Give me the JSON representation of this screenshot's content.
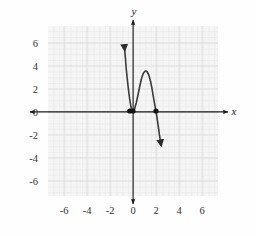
{
  "figure": {
    "background_color": "#fefefe",
    "plot_background_color": "#f5f5f5",
    "grid_minor_color": "#e4e4e4",
    "grid_major_color": "#d8d8d8",
    "axis_color": "#1a1a1a",
    "curve_color": "#3a3a3a",
    "point_color": "#141414"
  },
  "axes": {
    "x_name": "x",
    "y_name": "y",
    "x_ticks": [
      "-6",
      "-4",
      "-2",
      "0",
      "2",
      "4",
      "6"
    ],
    "y_ticks": [
      "6",
      "4",
      "2",
      "0",
      "-2",
      "-4",
      "-6"
    ],
    "x_tick_values": [
      -6,
      -4,
      -2,
      0,
      2,
      4,
      6
    ],
    "y_tick_values": [
      6,
      4,
      2,
      0,
      -2,
      -4,
      -6
    ]
  },
  "chart_data": {
    "type": "line",
    "title": "",
    "xlabel": "x",
    "ylabel": "y",
    "xlim": [
      -7.4,
      7.4
    ],
    "ylim": [
      -7.4,
      7.4
    ],
    "grid": true,
    "grid_minor_step": 0.5,
    "grid_major_step": 2,
    "legend": "none",
    "series": [
      {
        "name": "cubic",
        "equation": "y = -2.7x^2(x - 2)",
        "style": "solid-with-arrowheads",
        "arrow_start": {
          "x": -0.72,
          "y": 7.4
        },
        "arrow_end": {
          "x": 2.45,
          "y": -7.4
        },
        "x": [
          -0.72,
          -0.65,
          -0.6,
          -0.5,
          -0.4,
          -0.3,
          -0.2,
          -0.1,
          0.0,
          0.15,
          0.3,
          0.45,
          0.6,
          0.75,
          0.9,
          1.05,
          1.2,
          1.35,
          1.5,
          1.65,
          1.8,
          1.9,
          2.0,
          2.1,
          2.2,
          2.3,
          2.45
        ],
        "y": [
          5.29,
          4.51,
          3.79,
          2.81,
          1.91,
          1.12,
          0.48,
          0.08,
          0.0,
          0.22,
          0.77,
          1.48,
          2.22,
          2.85,
          3.29,
          3.47,
          3.46,
          3.2,
          2.7,
          1.98,
          1.07,
          0.51,
          0.0,
          -0.64,
          -1.31,
          -2.06,
          -3.0
        ]
      }
    ],
    "annotations": [
      {
        "type": "point",
        "label": "root (double)",
        "x": 0,
        "y": 0
      },
      {
        "type": "point",
        "label": "root",
        "x": 2,
        "y": 0
      },
      {
        "type": "point",
        "label": "near-origin marker",
        "x": -0.28,
        "y": 0
      }
    ]
  }
}
